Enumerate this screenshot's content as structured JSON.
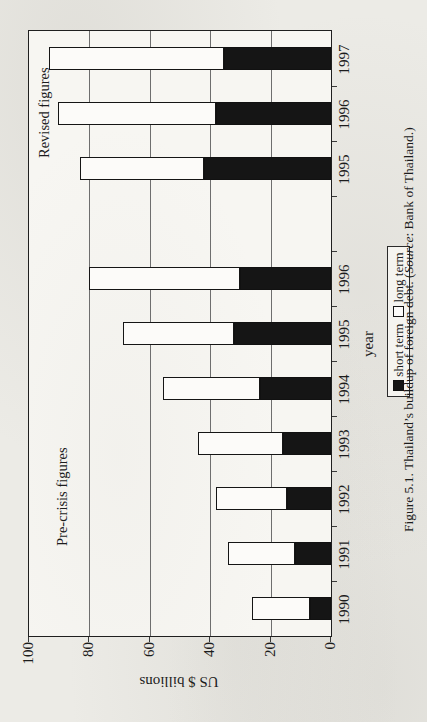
{
  "page": {
    "kind": "scanned book figure, landscape chart rotated 90 degrees counter-clockwise on portrait page",
    "background_color": "#ecebe6"
  },
  "caption": {
    "part1": "Figure 5.1.  Thailand’s buildup of foreign debt. (",
    "source_word": "Source",
    "part2": ": Bank of Thailand.)"
  },
  "legend": {
    "short_label": "short term",
    "long_label": "long term"
  },
  "chart_data": {
    "type": "bar",
    "stacked": true,
    "orientation": "vertical columns (figure printed rotated -90deg)",
    "title": "",
    "xlabel": "year",
    "ylabel": "US $ billions",
    "ylim": [
      0,
      100
    ],
    "yticks": [
      0,
      20,
      40,
      60,
      80,
      100
    ],
    "grid": "horizontal value gridlines on",
    "legend_position": "below axis, boxed",
    "categories": [
      "1990",
      "1991",
      "1992",
      "1993",
      "1994",
      "1995",
      "1996",
      "",
      "1995",
      "1996",
      "1997"
    ],
    "series": [
      {
        "name": "short term",
        "color": "#151515",
        "values": [
          7,
          12,
          14.5,
          16,
          23.5,
          32,
          30,
          null,
          42,
          38,
          35.5
        ]
      },
      {
        "name": "long term",
        "color": "#fcfbf9",
        "values": [
          19,
          22,
          23.5,
          28,
          32,
          37,
          50,
          null,
          41,
          52.5,
          58
        ]
      }
    ],
    "totals": [
      26,
      34,
      38,
      44,
      55.5,
      69,
      80,
      null,
      83,
      90.5,
      93.5
    ],
    "annotations": [
      {
        "text": "Pre-crisis figures",
        "over_categories": "1990–1996 group"
      },
      {
        "text": "Revised figures",
        "over_categories": "1995–1997 group"
      }
    ]
  }
}
